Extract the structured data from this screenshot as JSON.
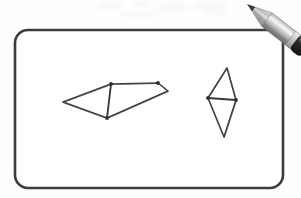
{
  "scene": {
    "title": "Hand-drawn geometry sketch on a rounded whiteboard frame",
    "background_color": "#fefefe",
    "ink_color": "#3a3a3a",
    "frame": {
      "label": "Rounded rectangle drawing frame",
      "x": 15,
      "y": 30,
      "width": 268,
      "height": 158,
      "corner_radius": 13,
      "stroke_color": "#3c3c3c",
      "stroke_width": 2.6,
      "fill": "#ffffff"
    },
    "figures": [
      {
        "id": "left-figure",
        "label": "Left elongated quadrilateral with internal chord",
        "type": "polygon-with-chord",
        "stroke_color": "#3a3a3a",
        "stroke_width": 1.6,
        "outline_points": [
          [
            63,
            102
          ],
          [
            111,
            84
          ],
          [
            158,
            83
          ],
          [
            168,
            91
          ],
          [
            107,
            118
          ]
        ],
        "chord": {
          "label": "internal vertical chord",
          "from": [
            111,
            84
          ],
          "to": [
            107,
            118
          ]
        },
        "vertex_markers": [
          [
            111,
            84
          ],
          [
            107,
            118
          ],
          [
            158,
            83
          ]
        ]
      },
      {
        "id": "right-figure",
        "label": "Right kite diamond with horizontal chord",
        "type": "kite-with-chord",
        "stroke_color": "#3a3a3a",
        "stroke_width": 1.6,
        "outline_points": [
          [
            227,
            68
          ],
          [
            236,
            100
          ],
          [
            224,
            137
          ],
          [
            208,
            98
          ]
        ],
        "chord": {
          "label": "internal horizontal chord",
          "from": [
            208,
            98
          ],
          "to": [
            236,
            100
          ]
        },
        "vertex_markers": [
          [
            208,
            98
          ],
          [
            236,
            100
          ]
        ]
      }
    ],
    "pencil": {
      "label": "Grey pencil resting over the top-right corner",
      "tip_point": [
        245,
        41
      ],
      "cap_point": [
        294,
        3
      ],
      "body_color_light": "#d2d2d2",
      "body_color_mid": "#9a9a9a",
      "body_color_dark": "#6f6f6f",
      "ferrule_color": "#cfcfcf",
      "cap_color": "#2e2e2e",
      "lead_color": "#3b3b3b",
      "wood_color": "#bdbdbd"
    },
    "smudges": [
      {
        "x": 96,
        "y": 2,
        "w": 26,
        "h": 7
      },
      {
        "x": 132,
        "y": 1,
        "w": 18,
        "h": 6
      },
      {
        "x": 158,
        "y": 3,
        "w": 30,
        "h": 8
      },
      {
        "x": 192,
        "y": 2,
        "w": 34,
        "h": 9
      },
      {
        "x": 205,
        "y": 10,
        "w": 22,
        "h": 5
      },
      {
        "x": 120,
        "y": 12,
        "w": 40,
        "h": 4
      }
    ]
  }
}
